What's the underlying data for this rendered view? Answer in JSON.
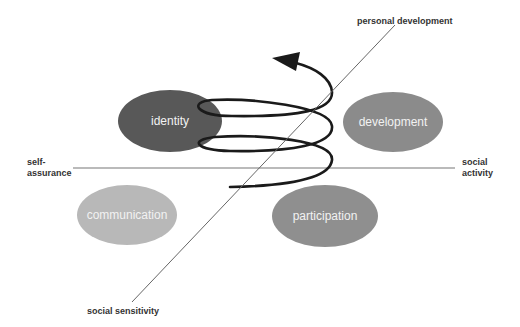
{
  "diagram": {
    "axes": {
      "vertical_top": "personal development",
      "vertical_bottom": "social sensitivity",
      "horizontal_left": "self-\nassurance",
      "horizontal_left_lines": [
        "self-",
        "assurance"
      ],
      "horizontal_right_lines": [
        "social",
        "activity"
      ]
    },
    "bubbles": [
      {
        "label": "identity",
        "color": "#585858"
      },
      {
        "label": "development",
        "color": "#8b8b8b"
      },
      {
        "label": "communication",
        "color": "#b8b8b8"
      },
      {
        "label": "participation",
        "color": "#8f8f8f"
      }
    ],
    "spiral": {
      "color": "#1a1a1a",
      "arrow": "up-left"
    },
    "line_color": "#6f6f6f"
  }
}
